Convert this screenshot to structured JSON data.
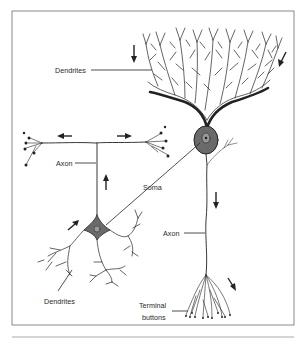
{
  "figure": {
    "labels": {
      "dendrites_top": "Dendrites",
      "axon_left": "Axon",
      "soma": "Soma",
      "axon_right": "Axon",
      "dendrites_bottom": "Dendrites",
      "terminal_line1": "Terminal",
      "terminal_line2": "buttons"
    },
    "colors": {
      "ink": "#222222",
      "soma_fill": "#6a6a6a",
      "frame": "#8a8a8a",
      "background": "#ffffff"
    }
  }
}
